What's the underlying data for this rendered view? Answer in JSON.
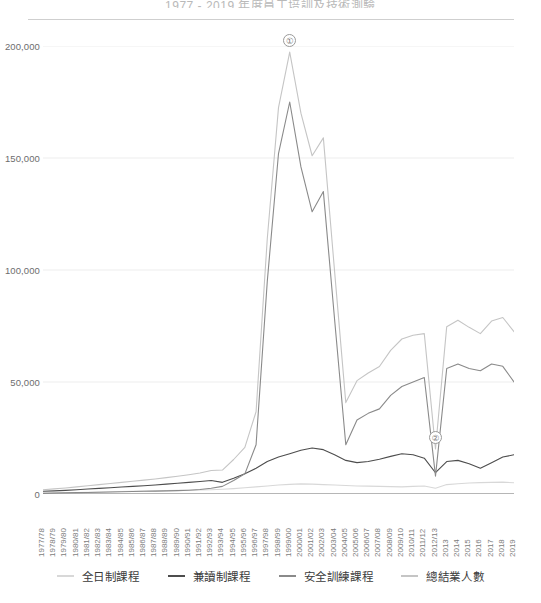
{
  "chart_data": {
    "type": "line",
    "title": "1977 - 2019 年度員工培訓及技術測驗",
    "xlabel": "",
    "ylabel": "",
    "ylim": [
      0,
      200000
    ],
    "yticks": [
      0,
      50000,
      100000,
      150000,
      200000
    ],
    "ytick_labels": [
      "0",
      "50,000",
      "100,000",
      "150,000",
      "200,000"
    ],
    "grid": true,
    "legend_position": "bottom",
    "categories": [
      "1977/78",
      "1978/79",
      "1979/80",
      "1980/81",
      "1981/82",
      "1982/83",
      "1983/84",
      "1984/85",
      "1985/86",
      "1986/87",
      "1987/88",
      "1988/89",
      "1989/90",
      "1990/91",
      "1991/92",
      "1992/93",
      "1993/94",
      "1994/95",
      "1995/96",
      "1996/97",
      "1997/98",
      "1998/99",
      "1999/00",
      "2000/01",
      "2001/02",
      "2002/03",
      "2003/04",
      "2004/05",
      "2005/06",
      "2006/07",
      "2007/08",
      "2008/09",
      "2009/10",
      "2010/11",
      "2011/12",
      "2012/13",
      "2013",
      "2014",
      "2015",
      "2016",
      "2017",
      "2018",
      "2019"
    ],
    "series": [
      {
        "name": "全日制課程",
        "color": "#d8d8d8",
        "values": [
          400,
          500,
          600,
          700,
          800,
          900,
          1000,
          1100,
          1200,
          1300,
          1400,
          1500,
          1600,
          1700,
          1800,
          1900,
          2100,
          2400,
          2800,
          3200,
          3600,
          4000,
          4300,
          4500,
          4400,
          4200,
          4000,
          3800,
          3600,
          3500,
          3400,
          3300,
          3200,
          3400,
          3600,
          2600,
          4200,
          4600,
          4900,
          5100,
          5200,
          5300,
          5000
        ]
      },
      {
        "name": "兼讀制課程",
        "color": "#4d4d4d",
        "values": [
          1200,
          1400,
          1600,
          1900,
          2200,
          2500,
          2800,
          3100,
          3400,
          3700,
          4000,
          4400,
          4800,
          5200,
          5600,
          6000,
          5200,
          7000,
          9000,
          11500,
          14500,
          16500,
          18000,
          19500,
          20500,
          19800,
          17500,
          15000,
          14000,
          14500,
          15500,
          16800,
          18000,
          17500,
          16000,
          9500,
          14500,
          15000,
          13500,
          11500,
          14000,
          16500,
          17500
        ]
      },
      {
        "name": "安全訓練課程",
        "color": "#8a8a8a",
        "values": [
          300,
          400,
          500,
          600,
          700,
          800,
          900,
          1000,
          1100,
          1200,
          1300,
          1400,
          1500,
          1700,
          2000,
          2600,
          3400,
          6000,
          9000,
          22000,
          95000,
          152000,
          175000,
          146000,
          126000,
          135000,
          78000,
          22000,
          33000,
          36000,
          38000,
          44000,
          48000,
          50000,
          52000,
          8000,
          56000,
          58000,
          56000,
          55000,
          58000,
          57000,
          50000
        ]
      },
      {
        "name": "總結業人數",
        "color": "#c5c5c5",
        "values": [
          1900,
          2300,
          2700,
          3200,
          3700,
          4200,
          4700,
          5200,
          5700,
          6200,
          6700,
          7300,
          7900,
          8600,
          9400,
          10500,
          10700,
          15400,
          20800,
          36700,
          114100,
          172500,
          197300,
          170000,
          151000,
          159000,
          99500,
          40800,
          50600,
          54000,
          56900,
          64100,
          69200,
          70900,
          71600,
          20100,
          74700,
          77600,
          74400,
          71600,
          77200,
          78800,
          72500
        ]
      }
    ],
    "annotations": [
      {
        "id": "1",
        "glyph": "①",
        "category": "1999/00",
        "value": 197300
      },
      {
        "id": "2",
        "glyph": "②",
        "category": "2012/13",
        "value": 20100
      }
    ]
  },
  "legend": {
    "items": [
      {
        "label": "全日制課程",
        "color": "#d8d8d8"
      },
      {
        "label": "兼讀制課程",
        "color": "#4d4d4d"
      },
      {
        "label": "安全訓練課程",
        "color": "#8a8a8a"
      },
      {
        "label": "總結業人數",
        "color": "#c5c5c5"
      }
    ]
  }
}
